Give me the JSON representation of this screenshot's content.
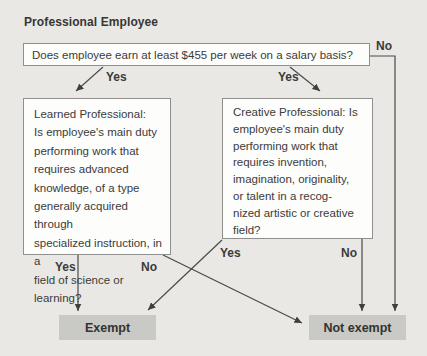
{
  "title": "Professional Employee",
  "question": {
    "text": "Does employee earn at least $455 per week on a salary basis?"
  },
  "labels": {
    "top_no": "No",
    "question_yes_left": "Yes",
    "question_yes_right": "Yes",
    "learned_yes": "Yes",
    "learned_no": "No",
    "creative_yes": "Yes",
    "creative_no": "No"
  },
  "branches": {
    "learned": {
      "text": "Learned Professional:\nIs employee's main duty\nperforming work that\nrequires advanced\nknowledge, of a type\ngenerally acquired through\nspecialized instruction, in a\nfield of science or learning?"
    },
    "creative": {
      "text": "Creative Professional: Is\nemployee's main duty\nperforming work that\nrequires invention,\nimagination, originality,\nor talent in a recog-\nnized artistic or creative\nfield?"
    }
  },
  "outcomes": {
    "exempt": "Exempt",
    "not_exempt": "Not exempt"
  },
  "colors": {
    "background": "#e9e8e4",
    "box_fill": "#fdfdfb",
    "box_border": "#8f8f8d",
    "terminal_fill": "#c9c9c5",
    "line": "#4a4a48",
    "text": "#3b3b3b"
  }
}
